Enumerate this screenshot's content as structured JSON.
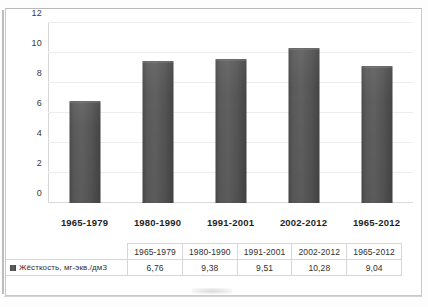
{
  "chart_data": {
    "type": "bar",
    "title": "",
    "subtitle": "",
    "xlabel": "",
    "ylabel": "",
    "categories": [
      "1965-1979",
      "1980-1990",
      "1991-2001",
      "2002-2012",
      "1965-2012"
    ],
    "series": [
      {
        "name": "Жёсткость, мг-экв./дм3",
        "values": [
          6.76,
          9.38,
          9.51,
          10.28,
          9.04
        ],
        "value_labels": [
          "6,76",
          "9,38",
          "9,51",
          "10,28",
          "9,04"
        ],
        "color": "#555555"
      }
    ],
    "ylim": [
      0,
      12
    ],
    "yticks": [
      0,
      2,
      4,
      6,
      8,
      10,
      12
    ],
    "ytick_labels": [
      "0",
      "2",
      "4",
      "6",
      "8",
      "10",
      "12"
    ],
    "grid": true,
    "grid_axis": "y",
    "legend_position": "table-left",
    "data_table_visible": true
  },
  "table": {
    "corner_label": "",
    "column_headers": [
      "1965-1979",
      "1980-1990",
      "1991-2001",
      "2002-2012",
      "1965-2012"
    ],
    "rows": [
      {
        "label": "Жёсткость, мг-экв./дм3",
        "cells": [
          "6,76",
          "9,38",
          "9,51",
          "10,28",
          "9,04"
        ]
      }
    ]
  },
  "colors": {
    "bar": "#555555",
    "gridline": "#ededed",
    "axis": "#d6d6d6",
    "table_border": "#d6d6d6",
    "text": "#2b2b2b",
    "page": "#ffffff"
  }
}
